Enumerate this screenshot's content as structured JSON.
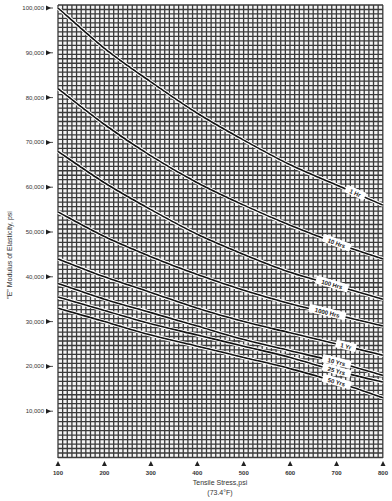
{
  "chart_data": {
    "type": "line",
    "title": "",
    "xlabel": "Tensile Stress,psi",
    "xlabel_sub": "(73.4°F)",
    "ylabel": "\"E\" Modulus of Elasticity, psi",
    "x": [
      100,
      200,
      300,
      400,
      500,
      600,
      700,
      800
    ],
    "x_tick_labels": [
      "100",
      "200",
      "300",
      "400",
      "500",
      "600",
      "700",
      "800"
    ],
    "y_tick_values": [
      10000,
      20000,
      30000,
      40000,
      50000,
      60000,
      70000,
      80000,
      90000,
      100000
    ],
    "y_tick_labels": [
      "10,000",
      "20,000",
      "30,000",
      "40,000",
      "50,000",
      "60,000",
      "70,000",
      "80,000",
      "90,000",
      "100,000"
    ],
    "xlim": [
      100,
      800
    ],
    "ylim": [
      0,
      100000
    ],
    "grid": true,
    "legend": "inline labels at right end of each curve",
    "series": [
      {
        "name": "1 Hr",
        "values": [
          100000,
          91000,
          83500,
          76500,
          70500,
          65000,
          60500,
          56000
        ]
      },
      {
        "name": "10 Hrs",
        "values": [
          82000,
          74000,
          67000,
          61000,
          56000,
          51500,
          47500,
          44000
        ]
      },
      {
        "name": "100 Hrs",
        "values": [
          68000,
          61000,
          55000,
          49500,
          45000,
          41000,
          38000,
          35000
        ]
      },
      {
        "name": "1000 Hrs",
        "values": [
          54500,
          49000,
          44500,
          40500,
          37000,
          34000,
          31500,
          29000
        ]
      },
      {
        "name": "1 Yr",
        "values": [
          44000,
          40000,
          36500,
          33000,
          30000,
          27500,
          25000,
          22500
        ]
      },
      {
        "name": "10 Yrs",
        "values": [
          38500,
          35000,
          32000,
          29000,
          26000,
          23500,
          21000,
          18000
        ]
      },
      {
        "name": "25 Yrs",
        "values": [
          35500,
          32500,
          29500,
          27000,
          24500,
          22000,
          19000,
          16500
        ]
      },
      {
        "name": "50 Yrs",
        "values": [
          33000,
          30000,
          27000,
          24500,
          22000,
          19500,
          16500,
          13000
        ]
      }
    ],
    "label_positions": [
      {
        "name": "1 Hr",
        "x": 740
      },
      {
        "name": "10 Hrs",
        "x": 700
      },
      {
        "name": "100 Hrs",
        "x": 690
      },
      {
        "name": "1000 Hrs",
        "x": 680
      },
      {
        "name": "1 Yr",
        "x": 720
      },
      {
        "name": "10 Yrs",
        "x": 700
      },
      {
        "name": "25 Yrs",
        "x": 700
      },
      {
        "name": "50 Yrs",
        "x": 700
      }
    ]
  },
  "colors": {
    "grid": "#3a3a3a",
    "curve": "#111111",
    "background": "#ffffff"
  }
}
